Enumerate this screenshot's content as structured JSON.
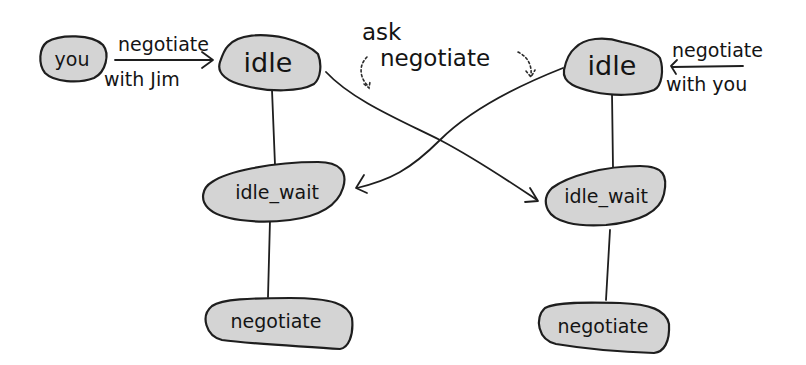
{
  "diagram": {
    "nodes": {
      "you": "you",
      "left_idle": "idle",
      "left_idle_wait": "idle_wait",
      "left_negotiate": "negotiate",
      "right_idle": "idle",
      "right_idle_wait": "idle_wait",
      "right_negotiate": "negotiate"
    },
    "labels": {
      "left_in_top": "negotiate",
      "left_in_bottom": "with Jim",
      "right_in_top": "negotiate",
      "right_in_bottom": "with you",
      "center_top": "ask",
      "center_bottom": "negotiate"
    },
    "colors": {
      "node_fill": "#d4d4d4",
      "stroke": "#1e1e1e",
      "background": "#ffffff"
    }
  }
}
